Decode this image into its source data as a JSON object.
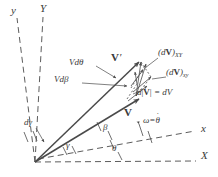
{
  "figure": {
    "stroke_color": "#4a4a4a",
    "text_color": "#3a3a3a",
    "background": "#ffffff",
    "width": 218,
    "height": 177
  },
  "axes": [
    {
      "name": "y-rotating",
      "label": "y",
      "style": "dashed",
      "x": 12,
      "y": 6
    },
    {
      "name": "Y-fixed",
      "label": "Y",
      "style": "dashed",
      "x": 41,
      "y": 4
    },
    {
      "name": "x-rotating",
      "label": "x",
      "style": "dashed",
      "x": 202,
      "y": 127
    },
    {
      "name": "X-fixed",
      "label": "X",
      "style": "dashed",
      "x": 202,
      "y": 153
    }
  ],
  "vectors": [
    {
      "name": "V-prime",
      "label": "V",
      "prime": "′",
      "x": 113,
      "y": 55
    },
    {
      "name": "V",
      "label": "V",
      "prime": "",
      "x": 125,
      "y": 110
    }
  ],
  "angles": [
    {
      "name": "d-gamma",
      "label": "dγ",
      "x": 26,
      "y": 122
    },
    {
      "name": "gamma",
      "label": "γ",
      "x": 67,
      "y": 145
    },
    {
      "name": "beta",
      "label": "β",
      "x": 104,
      "y": 127
    },
    {
      "name": "theta",
      "label": "θ",
      "x": 113,
      "y": 148
    }
  ],
  "components": [
    {
      "name": "V-d-theta",
      "label": "Vdθ",
      "x": 71,
      "y": 61
    },
    {
      "name": "V-d-beta",
      "label": "Vdβ",
      "x": 56,
      "y": 78
    },
    {
      "name": "dV-XY",
      "label": "(dV)",
      "sub": "XY",
      "x": 160,
      "y": 52
    },
    {
      "name": "dV-xy",
      "label": "(dV)",
      "sub": "xy",
      "x": 168,
      "y": 72
    },
    {
      "name": "d-mag-V",
      "label": "d|V| = dV",
      "x": 139,
      "y": 92
    }
  ],
  "omega": {
    "name": "omega-theta-dot",
    "omega_symbol": "ω",
    "equals": "=",
    "theta_symbol": "θ",
    "dot": "·",
    "x": 144,
    "y": 120
  }
}
